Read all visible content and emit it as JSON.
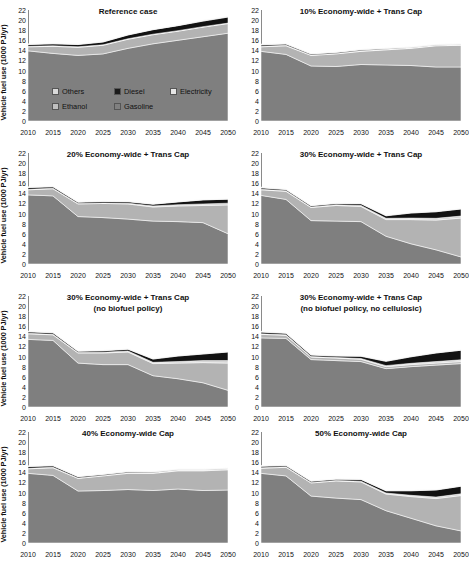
{
  "figure": {
    "ylabel": "Vehicle fuel use (1000 PJ/yr)",
    "xticks": [
      "2010",
      "2015",
      "2020",
      "2025",
      "2030",
      "2035",
      "2040",
      "2045",
      "2050"
    ],
    "yticks": [
      "0",
      "2",
      "4",
      "6",
      "8",
      "10",
      "12",
      "14",
      "16",
      "18",
      "20",
      "22"
    ]
  },
  "legend": {
    "position": "inside-panel-1",
    "items": [
      {
        "label": "Others",
        "color": "#d9d9d9"
      },
      {
        "label": "Diesel",
        "color": "#1a1a1a"
      },
      {
        "label": "Electricity",
        "color": "#e6e6e6"
      },
      {
        "label": "Ethanol",
        "color": "#bfbfbf"
      },
      {
        "label": "Gasoline",
        "color": "#808080"
      }
    ]
  },
  "colors": {
    "gasoline": "#7f7f7f",
    "ethanol": "#b3b3b3",
    "electricity": "#d4d4d4",
    "diesel": "#121212",
    "others": "#f2f2f2",
    "axis": "#8a8a8a",
    "plot_bg": "#ffffff"
  },
  "chart_data": [
    {
      "type": "area",
      "stacked": true,
      "title": "Reference case",
      "subtitle": "",
      "xlabel": "",
      "ylabel": "Vehicle fuel use (1000 PJ/yr)",
      "x": [
        2010,
        2015,
        2020,
        2025,
        2030,
        2035,
        2040,
        2045,
        2050
      ],
      "xlim": [
        2010,
        2050
      ],
      "ylim": [
        0,
        22
      ],
      "grid": false,
      "series": [
        {
          "name": "Gasoline",
          "values": [
            13.9,
            13.4,
            13.0,
            13.3,
            14.4,
            15.3,
            16.0,
            16.7,
            17.4
          ]
        },
        {
          "name": "Ethanol",
          "values": [
            0.8,
            1.4,
            1.6,
            1.7,
            1.8,
            1.8,
            1.8,
            1.9,
            1.9
          ]
        },
        {
          "name": "Electricity",
          "values": [
            0.1,
            0.1,
            0.1,
            0.1,
            0.1,
            0.1,
            0.1,
            0.1,
            0.1
          ]
        },
        {
          "name": "Diesel",
          "values": [
            0.35,
            0.4,
            0.45,
            0.55,
            0.75,
            0.9,
            1.0,
            1.1,
            1.2
          ]
        },
        {
          "name": "Others",
          "values": [
            0.15,
            0.15,
            0.15,
            0.15,
            0.15,
            0.15,
            0.2,
            0.2,
            0.2
          ]
        }
      ]
    },
    {
      "type": "area",
      "stacked": true,
      "title": "10% Economy-wide + Trans Cap",
      "subtitle": "",
      "xlabel": "",
      "ylabel": "Vehicle fuel use (1000 PJ/yr)",
      "x": [
        2010,
        2015,
        2020,
        2025,
        2030,
        2035,
        2040,
        2045,
        2050
      ],
      "xlim": [
        2010,
        2050
      ],
      "ylim": [
        0,
        22
      ],
      "grid": false,
      "series": [
        {
          "name": "Gasoline",
          "values": [
            13.8,
            13.2,
            10.9,
            10.8,
            11.2,
            11.1,
            11.0,
            10.7,
            10.7
          ]
        },
        {
          "name": "Ethanol",
          "values": [
            0.9,
            1.7,
            2.1,
            2.5,
            2.6,
            3.0,
            3.4,
            4.2,
            4.3
          ]
        },
        {
          "name": "Electricity",
          "values": [
            0.1,
            0.1,
            0.1,
            0.1,
            0.1,
            0.1,
            0.1,
            0.1,
            0.1
          ]
        },
        {
          "name": "Diesel",
          "values": [
            0.3,
            0.25,
            0.2,
            0.2,
            0.2,
            0.15,
            0.1,
            0.1,
            0.1
          ]
        },
        {
          "name": "Others",
          "values": [
            0.15,
            0.15,
            0.15,
            0.15,
            0.15,
            0.15,
            0.15,
            0.15,
            0.15
          ]
        }
      ]
    },
    {
      "type": "area",
      "stacked": true,
      "title": "20% Economy-wide + Trans Cap",
      "subtitle": "",
      "xlabel": "",
      "ylabel": "Vehicle fuel use (1000 PJ/yr)",
      "x": [
        2010,
        2015,
        2020,
        2025,
        2030,
        2035,
        2040,
        2045,
        2050
      ],
      "xlim": [
        2010,
        2050
      ],
      "ylim": [
        0,
        22
      ],
      "grid": false,
      "series": [
        {
          "name": "Gasoline",
          "values": [
            13.7,
            13.5,
            9.4,
            9.2,
            8.9,
            8.5,
            8.4,
            8.2,
            6.0
          ]
        },
        {
          "name": "Ethanol",
          "values": [
            1.0,
            1.4,
            2.5,
            2.8,
            3.0,
            2.8,
            3.1,
            3.4,
            5.7
          ]
        },
        {
          "name": "Electricity",
          "values": [
            0.1,
            0.1,
            0.1,
            0.1,
            0.15,
            0.2,
            0.25,
            0.3,
            0.35
          ]
        },
        {
          "name": "Diesel",
          "values": [
            0.35,
            0.3,
            0.25,
            0.3,
            0.3,
            0.35,
            0.55,
            0.8,
            0.8
          ]
        },
        {
          "name": "Others",
          "values": [
            0.15,
            0.15,
            0.15,
            0.15,
            0.15,
            0.15,
            0.15,
            0.15,
            0.15
          ]
        }
      ]
    },
    {
      "type": "area",
      "stacked": true,
      "title": "30% Economy-wide + Trans Cap",
      "subtitle": "",
      "xlabel": "",
      "ylabel": "Vehicle fuel use (1000 PJ/yr)",
      "x": [
        2010,
        2015,
        2020,
        2025,
        2030,
        2035,
        2040,
        2045,
        2050
      ],
      "xlim": [
        2010,
        2050
      ],
      "ylim": [
        0,
        22
      ],
      "grid": false,
      "series": [
        {
          "name": "Gasoline",
          "values": [
            13.6,
            12.8,
            8.6,
            8.5,
            8.4,
            5.5,
            4.0,
            2.8,
            1.4
          ]
        },
        {
          "name": "Ethanol",
          "values": [
            1.1,
            1.6,
            2.6,
            3.1,
            3.0,
            3.3,
            4.8,
            5.9,
            7.7
          ]
        },
        {
          "name": "Electricity",
          "values": [
            0.1,
            0.1,
            0.1,
            0.15,
            0.2,
            0.25,
            0.3,
            0.35,
            0.4
          ]
        },
        {
          "name": "Diesel",
          "values": [
            0.3,
            0.25,
            0.25,
            0.25,
            0.35,
            0.5,
            1.0,
            1.3,
            1.4
          ]
        },
        {
          "name": "Others",
          "values": [
            0.15,
            0.15,
            0.15,
            0.15,
            0.15,
            0.15,
            0.15,
            0.15,
            0.15
          ]
        }
      ]
    },
    {
      "type": "area",
      "stacked": true,
      "title": "30% Economy-wide + Trans Cap",
      "subtitle": "(no biofuel policy)",
      "xlabel": "",
      "ylabel": "Vehicle fuel use (1000 PJ/yr)",
      "x": [
        2010,
        2015,
        2020,
        2025,
        2030,
        2035,
        2040,
        2045,
        2050
      ],
      "xlim": [
        2010,
        2050
      ],
      "ylim": [
        0,
        22
      ],
      "grid": false,
      "series": [
        {
          "name": "Gasoline",
          "values": [
            13.4,
            13.2,
            8.7,
            8.4,
            8.4,
            6.2,
            5.6,
            4.8,
            3.3
          ]
        },
        {
          "name": "Ethanol",
          "values": [
            1.1,
            1.1,
            2.0,
            2.3,
            2.5,
            2.4,
            3.1,
            4.0,
            5.4
          ]
        },
        {
          "name": "Electricity",
          "values": [
            0.1,
            0.1,
            0.1,
            0.15,
            0.2,
            0.25,
            0.3,
            0.4,
            0.5
          ]
        },
        {
          "name": "Diesel",
          "values": [
            0.3,
            0.3,
            0.25,
            0.3,
            0.35,
            0.65,
            1.1,
            1.3,
            1.7
          ]
        },
        {
          "name": "Others",
          "values": [
            0.15,
            0.15,
            0.15,
            0.15,
            0.15,
            0.15,
            0.15,
            0.15,
            0.15
          ]
        }
      ]
    },
    {
      "type": "area",
      "stacked": true,
      "title": "30% Economy-wide + Trans Cap",
      "subtitle": "(no biofuel policy,  no cellulosic)",
      "xlabel": "",
      "ylabel": "Vehicle fuel use (1000 PJ/yr)",
      "x": [
        2010,
        2015,
        2020,
        2025,
        2030,
        2035,
        2040,
        2045,
        2050
      ],
      "xlim": [
        2010,
        2050
      ],
      "ylim": [
        0,
        22
      ],
      "grid": false,
      "series": [
        {
          "name": "Gasoline",
          "values": [
            13.7,
            13.6,
            9.4,
            9.2,
            9.0,
            7.6,
            8.0,
            8.3,
            8.6
          ]
        },
        {
          "name": "Ethanol",
          "values": [
            0.7,
            0.6,
            0.5,
            0.5,
            0.45,
            0.4,
            0.4,
            0.4,
            0.4
          ]
        },
        {
          "name": "Electricity",
          "values": [
            0.1,
            0.1,
            0.1,
            0.1,
            0.15,
            0.2,
            0.25,
            0.3,
            0.35
          ]
        },
        {
          "name": "Diesel",
          "values": [
            0.35,
            0.3,
            0.3,
            0.3,
            0.45,
            0.85,
            1.3,
            1.7,
            1.9
          ]
        },
        {
          "name": "Others",
          "values": [
            0.15,
            0.15,
            0.15,
            0.15,
            0.15,
            0.15,
            0.15,
            0.15,
            0.15
          ]
        }
      ]
    },
    {
      "type": "area",
      "stacked": true,
      "title": "40% Economy-wide Cap",
      "subtitle": "",
      "xlabel": "",
      "ylabel": "Vehicle fuel use (1000 PJ/yr)",
      "x": [
        2010,
        2015,
        2020,
        2025,
        2030,
        2035,
        2040,
        2045,
        2050
      ],
      "xlim": [
        2010,
        2050
      ],
      "ylim": [
        0,
        22
      ],
      "grid": false,
      "series": [
        {
          "name": "Gasoline",
          "values": [
            13.8,
            13.4,
            10.3,
            10.4,
            10.6,
            10.4,
            10.7,
            10.4,
            10.5
          ]
        },
        {
          "name": "Ethanol",
          "values": [
            0.9,
            1.5,
            2.5,
            2.9,
            3.2,
            3.4,
            3.6,
            3.9,
            4.0
          ]
        },
        {
          "name": "Electricity",
          "values": [
            0.1,
            0.1,
            0.1,
            0.1,
            0.1,
            0.1,
            0.15,
            0.15,
            0.15
          ]
        },
        {
          "name": "Diesel",
          "values": [
            0.35,
            0.3,
            0.25,
            0.2,
            0.2,
            0.15,
            0.1,
            0.1,
            0.1
          ]
        },
        {
          "name": "Others",
          "values": [
            0.15,
            0.15,
            0.15,
            0.15,
            0.15,
            0.15,
            0.15,
            0.15,
            0.15
          ]
        }
      ]
    },
    {
      "type": "area",
      "stacked": true,
      "title": "50% Economy-wide Cap",
      "subtitle": "",
      "xlabel": "",
      "ylabel": "Vehicle fuel use (1000 PJ/yr)",
      "x": [
        2010,
        2015,
        2020,
        2025,
        2030,
        2035,
        2040,
        2045,
        2050
      ],
      "xlim": [
        2010,
        2050
      ],
      "ylim": [
        0,
        22
      ],
      "grid": false,
      "series": [
        {
          "name": "Gasoline",
          "values": [
            13.8,
            13.3,
            9.3,
            8.9,
            8.6,
            6.4,
            4.9,
            3.4,
            2.4
          ]
        },
        {
          "name": "Ethanol",
          "values": [
            1.0,
            1.7,
            2.6,
            3.4,
            3.5,
            3.3,
            4.3,
            5.4,
            7.0
          ]
        },
        {
          "name": "Electricity",
          "values": [
            0.1,
            0.1,
            0.1,
            0.1,
            0.15,
            0.2,
            0.25,
            0.3,
            0.35
          ]
        },
        {
          "name": "Diesel",
          "values": [
            0.3,
            0.25,
            0.25,
            0.25,
            0.35,
            0.45,
            0.9,
            1.4,
            1.5
          ]
        },
        {
          "name": "Others",
          "values": [
            0.15,
            0.15,
            0.15,
            0.15,
            0.15,
            0.15,
            0.15,
            0.15,
            0.15
          ]
        }
      ]
    }
  ]
}
